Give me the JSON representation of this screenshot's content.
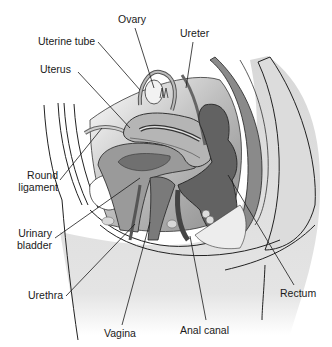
{
  "figure": {
    "labels": {
      "ovary": "Ovary",
      "uterine_tube": "Uterine tube",
      "ureter": "Ureter",
      "uterus": "Uterus",
      "round_ligament_1": "Round",
      "round_ligament_2": "ligament",
      "urinary_bladder_1": "Urinary",
      "urinary_bladder_2": "bladder",
      "urethra": "Urethra",
      "vagina": "Vagina",
      "anal_canal": "Anal canal",
      "rectum": "Rectum"
    }
  }
}
